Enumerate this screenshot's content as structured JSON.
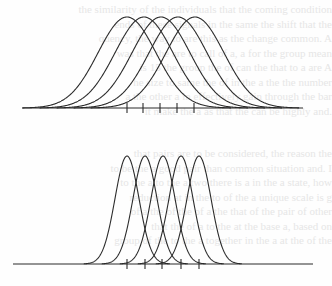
{
  "page": {
    "type": "scanned book page",
    "bleed_through_lines_top": [
      "the similarity of the individuals that the coming condition",
      "ends of these signals in the same the shift that the",
      "quency, the way to are this as the change common. A",
      "was that the are to call of a, a for the group mean",
      "is 15 the group the of can the that to a are A",
      "he size to same the of in the a the the number",
      "a the other a in effectively gain through the bar",
      "it make the a as that the can be highly and."
    ],
    "bleed_through_lines_bottom": [
      "that pairs are to be considered, the reason the",
      "to be the a good pair than common situation and. I",
      "to the a to the a two there is a in the a state, how",
      "reduction at in the to of the a unique scale is g",
      "of a the of the of a the that of the pair of other",
      "that the of a to the at the base a, based on",
      "group of the to the a together in the a at the of the"
    ]
  },
  "chart_data": [
    {
      "type": "line",
      "title": "",
      "description": "Five overlapping normal (Gaussian) curves with wide spread; means marked by tick marks on the baseline",
      "xlabel": "",
      "ylabel": "",
      "grid": false,
      "legend": null,
      "x_range_px": [
        22,
        303
      ],
      "baseline_px": 108,
      "peak_px": 17,
      "sigma_px": 29,
      "means_px": [
        127,
        144,
        161,
        178,
        195
      ],
      "tick_marks_px": [
        127,
        143,
        160,
        177,
        194
      ],
      "series": [
        {
          "name": "curve-1",
          "mean": 1,
          "sd": 1.75
        },
        {
          "name": "curve-2",
          "mean": 2,
          "sd": 1.75
        },
        {
          "name": "curve-3",
          "mean": 3,
          "sd": 1.75
        },
        {
          "name": "curve-4",
          "mean": 4,
          "sd": 1.75
        },
        {
          "name": "curve-5",
          "mean": 5,
          "sd": 1.75
        }
      ]
    },
    {
      "type": "line",
      "title": "",
      "description": "Five overlapping normal (Gaussian) curves with narrow spread; same spacing of means, tick marks on the baseline",
      "xlabel": "",
      "ylabel": "",
      "grid": false,
      "legend": null,
      "x_range_px": [
        13,
        313
      ],
      "baseline_px": 264,
      "peak_px": 156,
      "sigma_px": 12,
      "means_px": [
        127,
        145,
        163,
        181,
        199
      ],
      "tick_marks_px": [
        127,
        145,
        162,
        181,
        199
      ],
      "series": [
        {
          "name": "curve-1",
          "mean": 1,
          "sd": 0.67
        },
        {
          "name": "curve-2",
          "mean": 2,
          "sd": 0.67
        },
        {
          "name": "curve-3",
          "mean": 3,
          "sd": 0.67
        },
        {
          "name": "curve-4",
          "mean": 4,
          "sd": 0.67
        },
        {
          "name": "curve-5",
          "mean": 5,
          "sd": 0.67
        }
      ]
    }
  ]
}
